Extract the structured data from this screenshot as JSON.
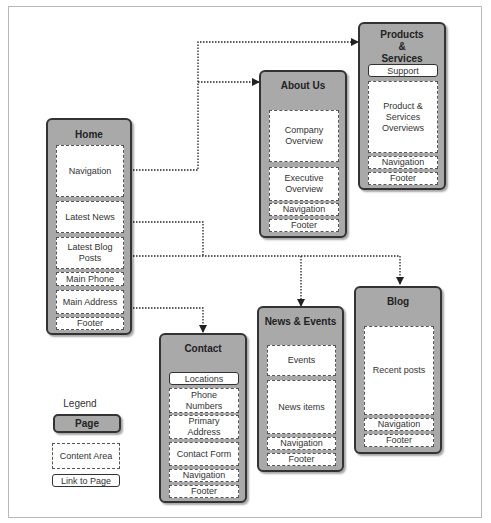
{
  "pages": {
    "home": {
      "title": "Home",
      "areas": [
        "Navigation",
        "Latest News",
        "Latest Blog Posts",
        "Main Phone",
        "Main Address",
        "Footer"
      ]
    },
    "about_us": {
      "title": "About Us",
      "areas": [
        "Company Overview",
        "Executive Overview",
        "Navigation",
        "Footer"
      ]
    },
    "products_services": {
      "title": "Products & Services",
      "links": [
        "Support"
      ],
      "areas": [
        "Product & Services Overviews",
        "Navigation",
        "Footer"
      ]
    },
    "contact": {
      "title": "Contact",
      "links": [
        "Locations"
      ],
      "areas": [
        "Phone Numbers",
        "Primary Address",
        "Contact Form",
        "Navigation",
        "Footer"
      ]
    },
    "news_events": {
      "title": "News & Events",
      "areas": [
        "Events",
        "News items",
        "Navigation",
        "Footer"
      ]
    },
    "blog": {
      "title": "Blog",
      "areas": [
        "Recent posts",
        "Navigation",
        "Footer"
      ]
    }
  },
  "connections": [
    {
      "from": "Home.Navigation",
      "to": "About Us"
    },
    {
      "from": "Home.Navigation",
      "to": "Products & Services"
    },
    {
      "from": "Home.Latest News",
      "to": "News & Events"
    },
    {
      "from": "Home.Latest Blog Posts",
      "to": "News & Events"
    },
    {
      "from": "Home.Latest Blog Posts",
      "to": "Blog"
    },
    {
      "from": "Home.Main Address",
      "to": "Contact"
    }
  ],
  "legend": {
    "title": "Legend",
    "page": "Page",
    "content_area": "Content Area",
    "link_to_page": "Link to Page"
  },
  "colors": {
    "page_fill": "#a9a9a9",
    "page_border": "#333333",
    "area_fill": "#ffffff",
    "connector": "#222222"
  }
}
